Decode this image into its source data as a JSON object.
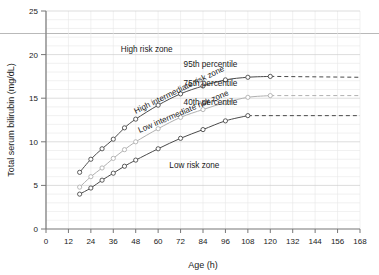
{
  "chart_data": {
    "type": "line",
    "title": "",
    "xlabel": "Age (h)",
    "ylabel": "Total serum bilirubin (mg/dL)",
    "xlim": [
      0,
      168
    ],
    "ylim": [
      0,
      25
    ],
    "xticks": [
      0,
      12,
      24,
      36,
      48,
      60,
      72,
      84,
      96,
      108,
      120,
      132,
      144,
      156,
      168
    ],
    "yticks": [
      0,
      5,
      10,
      15,
      20,
      25
    ],
    "grid": true,
    "minor_grid_y_step": 1,
    "minor_grid_x_step": 12,
    "legend": "inline-annotations",
    "marker": "open-circle",
    "series": [
      {
        "name": "95th percentile",
        "label": "95th percentile",
        "color": "#4a4a4a",
        "x": [
          18,
          24,
          30,
          36,
          42,
          48,
          60,
          72,
          84,
          96,
          108,
          120
        ],
        "y": [
          6.5,
          8.0,
          9.2,
          10.3,
          11.6,
          12.6,
          14.2,
          15.5,
          16.4,
          17.1,
          17.4,
          17.5
        ],
        "dashed_tail": {
          "x": [
            120,
            168
          ],
          "y": [
            17.5,
            17.4
          ]
        }
      },
      {
        "name": "75th percentile",
        "label": "75th percentile",
        "color": "#b0b0b0",
        "x": [
          18,
          24,
          30,
          36,
          42,
          48,
          60,
          72,
          84,
          96,
          108,
          120
        ],
        "y": [
          4.8,
          6.0,
          7.0,
          8.1,
          9.1,
          10.0,
          11.5,
          12.8,
          13.7,
          14.5,
          15.1,
          15.3
        ],
        "dashed_tail": {
          "x": [
            120,
            168
          ],
          "y": [
            15.3,
            15.3
          ]
        }
      },
      {
        "name": "40th percentile",
        "label": "40th percentile",
        "color": "#4a4a4a",
        "x": [
          18,
          24,
          30,
          36,
          42,
          48,
          60,
          72,
          84,
          96,
          108
        ],
        "y": [
          4.0,
          4.7,
          5.6,
          6.4,
          7.2,
          7.9,
          9.2,
          10.4,
          11.4,
          12.4,
          13.0
        ],
        "dashed_tail": {
          "x": [
            108,
            168
          ],
          "y": [
            13.0,
            13.0
          ]
        }
      }
    ],
    "annotations": [
      {
        "name": "high-risk-zone",
        "text": "High risk zone",
        "x": 40,
        "y": 20.3,
        "rotation": 0
      },
      {
        "name": "high-intermediate-risk-zone",
        "text": "High intermediate risk zone",
        "x": 48,
        "y": 13.2,
        "rotation": -26
      },
      {
        "name": "low-intermediate-risk-zone",
        "text": "Low intermediate risk zone",
        "x": 50,
        "y": 11.0,
        "rotation": -23
      },
      {
        "name": "low-risk-zone",
        "text": "Low risk zone",
        "x": 66,
        "y": 7.0,
        "rotation": 0
      }
    ]
  },
  "axes": {
    "y_title": "Total serum bilirubin (mg/dL)",
    "x_title": "Age (h)"
  }
}
